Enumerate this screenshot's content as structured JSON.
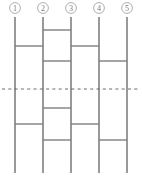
{
  "diagram": {
    "kind": "braid-crossing-diagram",
    "title": "",
    "canvas": {
      "width": 142,
      "height": 177,
      "background": "#ffffff"
    },
    "colors": {
      "strand": "#6e6e6e",
      "rung": "#7e7e7e",
      "axis": "#5a5a5a",
      "label_text": "#7a7a7a",
      "label_circle_stroke": "#9a9a9a",
      "background": "#ffffff"
    },
    "strands": [
      {
        "id": 1,
        "label": "1",
        "x": 15,
        "top": 17,
        "bottom": 173
      },
      {
        "id": 2,
        "label": "2",
        "x": 43,
        "top": 17,
        "bottom": 173
      },
      {
        "id": 3,
        "label": "3",
        "x": 71,
        "top": 17,
        "bottom": 173
      },
      {
        "id": 4,
        "label": "4",
        "x": 99,
        "top": 17,
        "bottom": 173
      },
      {
        "id": 5,
        "label": "5",
        "x": 127,
        "top": 17,
        "bottom": 173
      }
    ],
    "strand_labels": {
      "circle_radius": 5.4,
      "circle_center_y": 8,
      "values": [
        "1",
        "2",
        "3",
        "4",
        "5"
      ]
    },
    "rungs": [
      {
        "index": 1,
        "y": 30,
        "from_strand": 2,
        "to_strand": 3,
        "x1": 43,
        "x2": 71
      },
      {
        "index": 2,
        "y": 46,
        "from_strand": 1,
        "to_strand": 2,
        "x1": 15,
        "x2": 43
      },
      {
        "index": 3,
        "y": 46,
        "from_strand": 3,
        "to_strand": 4,
        "x1": 71,
        "x2": 99
      },
      {
        "index": 4,
        "y": 61,
        "from_strand": 2,
        "to_strand": 3,
        "x1": 43,
        "x2": 71
      },
      {
        "index": 5,
        "y": 61,
        "from_strand": 4,
        "to_strand": 5,
        "x1": 99,
        "x2": 127
      },
      {
        "index": 6,
        "y": 108,
        "from_strand": 2,
        "to_strand": 3,
        "x1": 43,
        "x2": 71
      },
      {
        "index": 7,
        "y": 124,
        "from_strand": 1,
        "to_strand": 2,
        "x1": 15,
        "x2": 43
      },
      {
        "index": 8,
        "y": 124,
        "from_strand": 3,
        "to_strand": 4,
        "x1": 71,
        "x2": 99
      },
      {
        "index": 9,
        "y": 140,
        "from_strand": 2,
        "to_strand": 3,
        "x1": 43,
        "x2": 71
      },
      {
        "index": 10,
        "y": 140,
        "from_strand": 4,
        "to_strand": 5,
        "x1": 99,
        "x2": 127
      }
    ],
    "axis": {
      "name": "symmetry-axis",
      "y": 89,
      "x1": 2,
      "x2": 140,
      "style": "dash-dot"
    }
  }
}
